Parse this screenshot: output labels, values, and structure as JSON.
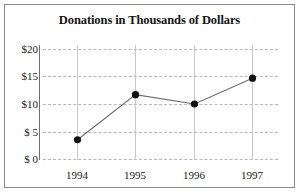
{
  "chart_data": {
    "type": "line",
    "title": "Donations in Thousands of Dollars",
    "xlabel": "",
    "ylabel": "",
    "categories": [
      "1994",
      "1995",
      "1996",
      "1997"
    ],
    "values": [
      3.5,
      11.7,
      10.0,
      14.7
    ],
    "series": [
      {
        "name": "Donations",
        "values": [
          3.5,
          11.7,
          10.0,
          14.7
        ]
      }
    ],
    "ylim": [
      0,
      20
    ],
    "ytick_values": [
      0,
      5,
      10,
      15,
      20
    ],
    "ytick_labels": [
      "$ 0",
      "$ 5",
      "$10",
      "$15",
      "$20"
    ],
    "xtick_labels": [
      "1994",
      "1995",
      "1996",
      "1997"
    ],
    "grid": true,
    "grid_style": "dashed",
    "legend": false,
    "legend_position": "none",
    "marker": "circle",
    "marker_color": "#111111",
    "line_color": "#6b6b6b",
    "grid_color": "#b9b9b9",
    "axis_color": "#6f6f6f",
    "background_color": "#ffffff",
    "border_color": "#8a8a8a"
  }
}
